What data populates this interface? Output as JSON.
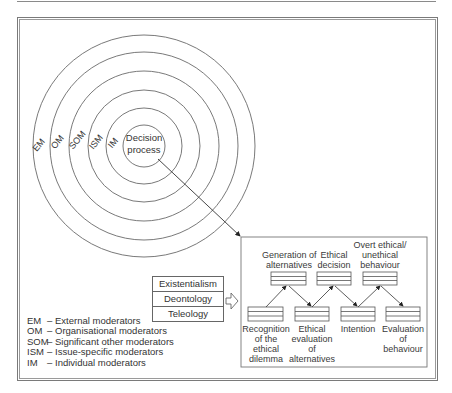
{
  "diagram": {
    "rings": [
      {
        "abbr": "EM",
        "radius": 111
      },
      {
        "abbr": "OM",
        "radius": 94
      },
      {
        "abbr": "SOM",
        "radius": 75
      },
      {
        "abbr": "ISM",
        "radius": 56
      },
      {
        "abbr": "IM",
        "radius": 38
      }
    ],
    "center": {
      "label_line1": "Decision",
      "label_line2": "process",
      "radius": 21
    },
    "philosophies": [
      "Existentialism",
      "Deontology",
      "Teleology"
    ],
    "process": {
      "top_row": [
        {
          "line1": "Generation of",
          "line2": "alternatives",
          "line3": ""
        },
        {
          "line1": "Ethical",
          "line2": "decision",
          "line3": ""
        },
        {
          "line1": "Overt ethical/",
          "line2": "unethical",
          "line3": "behaviour"
        }
      ],
      "bottom_row": [
        {
          "line1": "Recognition",
          "line2": "of the",
          "line3": "ethical",
          "line4": "dilemma"
        },
        {
          "line1": "Ethical",
          "line2": "evaluation",
          "line3": "of",
          "line4": "alternatives"
        },
        {
          "line1": "Intention",
          "line2": "",
          "line3": "",
          "line4": ""
        },
        {
          "line1": "Evaluation",
          "line2": "of",
          "line3": "behaviour",
          "line4": ""
        }
      ]
    },
    "legend": [
      {
        "abbr": "EM",
        "dash": "–",
        "text": "External moderators"
      },
      {
        "abbr": "OM",
        "dash": "–",
        "text": "Organisational moderators"
      },
      {
        "abbr": "SOM",
        "dash": "–",
        "text": "Significant other moderators"
      },
      {
        "abbr": "ISM",
        "dash": "–",
        "text": "Issue-specific moderators"
      },
      {
        "abbr": "IM",
        "dash": "–",
        "text": "Individual moderators"
      }
    ],
    "colors": {
      "line": "#6a6a6a",
      "text": "#333333",
      "background": "#ffffff"
    }
  }
}
